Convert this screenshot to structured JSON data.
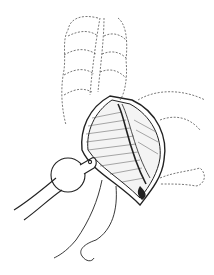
{
  "image": {
    "type": "line-illustration",
    "subject": "surgical-illustration",
    "width": 214,
    "height": 275,
    "background": "#ffffff",
    "stroke_color": "#222222",
    "dashed_color": "#555555"
  }
}
